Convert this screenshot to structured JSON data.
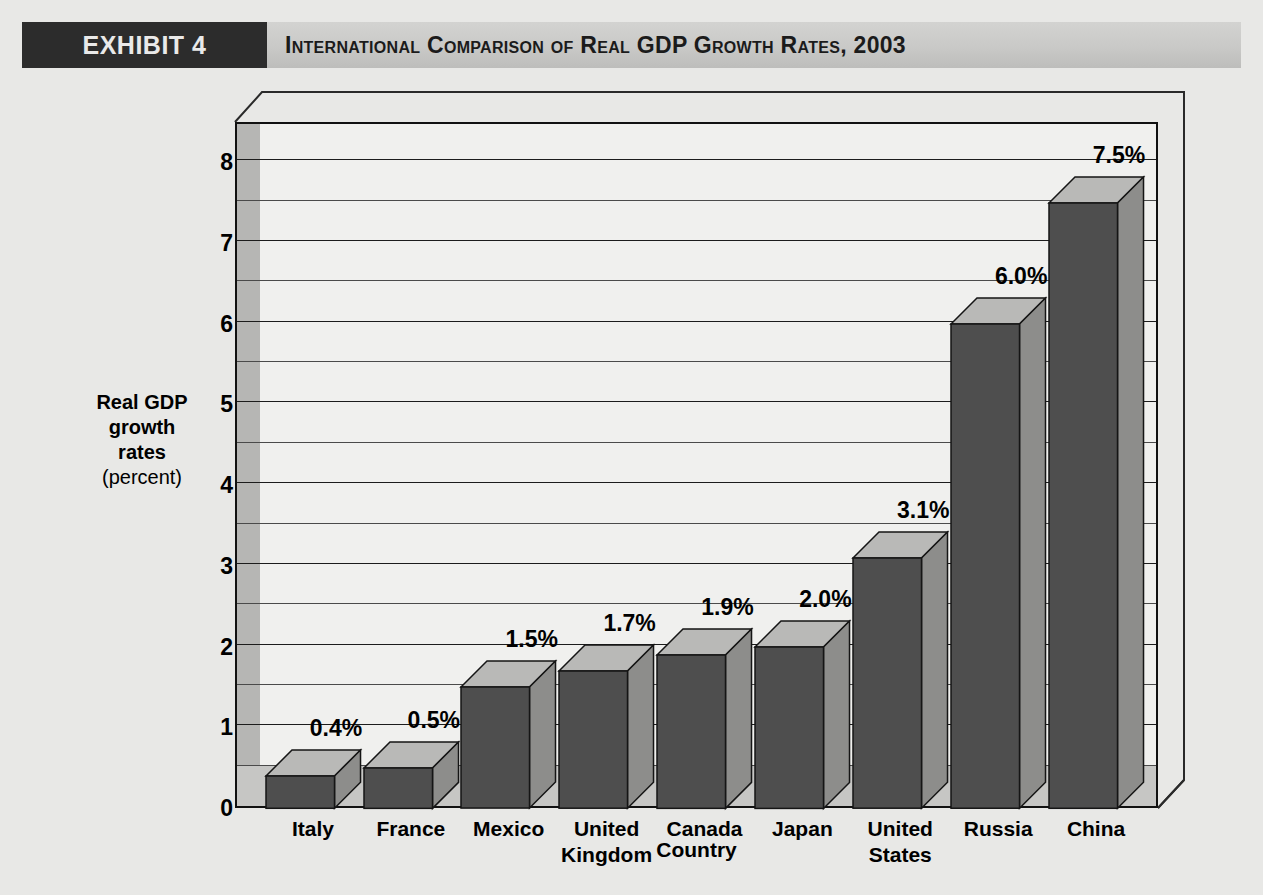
{
  "header": {
    "exhibit_label": "EXHIBIT 4",
    "title": "International Comparison of Real GDP Growth Rates, 2003"
  },
  "colors": {
    "page_background": "#e8e8e6",
    "header_band": "#c9c9c7",
    "exhibit_tag_background": "#2c2c2c",
    "exhibit_tag_text": "#e9e9e9",
    "plot_panel": "#f0f0ee",
    "floor_band": "#c6c6c4",
    "wall_left_strip": "#b6b6b4",
    "bar_front": "#4e4e4e",
    "bar_top": "#b9b9b7",
    "bar_side": "#8d8d8b",
    "gridline": "#1c1c1c",
    "axis": "#111111",
    "text": "#000000"
  },
  "axis": {
    "y_title_line1": "Real GDP",
    "y_title_line2": "growth",
    "y_title_line3": "rates",
    "y_title_unit": "(percent)",
    "x_title": "Country"
  },
  "chart_data": {
    "type": "bar",
    "title": "International Comparison of Real GDP Growth Rates, 2003",
    "xlabel": "Country",
    "ylabel": "Real GDP growth rates (percent)",
    "ylim": [
      0,
      8.5
    ],
    "yticks": [
      0,
      1,
      2,
      3,
      4,
      5,
      6,
      7,
      8
    ],
    "ytick_labels": [
      "0",
      "1",
      "2",
      "3",
      "4",
      "5",
      "6",
      "7",
      "8"
    ],
    "minor_gridline_step": 0.5,
    "grid": true,
    "legend": "none",
    "three_d": true,
    "categories": [
      "Italy",
      "France",
      "Mexico",
      "United Kingdom",
      "Canada",
      "Japan",
      "United States",
      "Russia",
      "China"
    ],
    "category_lines": [
      [
        "Italy"
      ],
      [
        "France"
      ],
      [
        "Mexico"
      ],
      [
        "United",
        "Kingdom"
      ],
      [
        "Canada"
      ],
      [
        "Japan"
      ],
      [
        "United",
        "States"
      ],
      [
        "Russia"
      ],
      [
        "China"
      ]
    ],
    "values": [
      0.4,
      0.5,
      1.5,
      1.7,
      1.9,
      2.0,
      3.1,
      6.0,
      7.5
    ],
    "data_labels": [
      "0.4%",
      "0.5%",
      "1.5%",
      "1.7%",
      "1.9%",
      "2.0%",
      "3.1%",
      "6.0%",
      "7.5%"
    ]
  }
}
